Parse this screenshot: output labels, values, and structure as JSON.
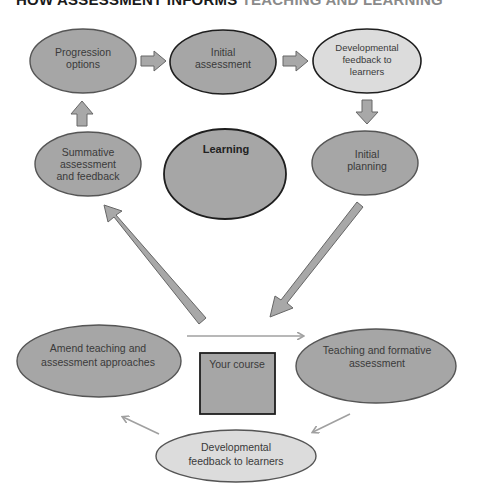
{
  "title": {
    "part1": "HOW ASSESSMENT INFORMS ",
    "part2": "TEACHING AND LEARNING"
  },
  "colors": {
    "node_fill": "#a6a6a6",
    "node_light_fill": "#dcdcdc",
    "node_stroke": "#555555",
    "dark_stroke": "#222222",
    "arrow_fill": "#a8a8a8",
    "arrow_stroke": "#666666",
    "thin_arrow": "#a0a0a0"
  },
  "top_cycle": {
    "progression": [
      "Progression",
      "options"
    ],
    "initial_assessment": [
      "Initial",
      "assessment"
    ],
    "dev_feedback_top": [
      "Developmental",
      "feedback to",
      "learners"
    ],
    "summative": [
      "Summative",
      "assessment",
      "and feedback"
    ],
    "learning": "Learning",
    "initial_planning": [
      "Initial",
      "planning"
    ]
  },
  "bottom_cycle": {
    "amend": [
      "Amend teaching and",
      "assessment approaches"
    ],
    "your_course": "Your course",
    "teaching_formative": [
      "Teaching and formative",
      "assessment"
    ],
    "dev_feedback_bottom": [
      "Developmental",
      "feedback to learners"
    ]
  }
}
